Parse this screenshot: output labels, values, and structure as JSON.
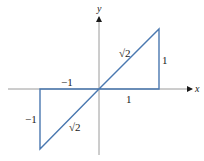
{
  "diagram": {
    "type": "coordinate-geometry",
    "colors": {
      "axis": "#9a9a9a",
      "shape": "#4a78b0",
      "text": "#1a1a1a",
      "background": "#ffffff"
    },
    "axes": {
      "x_label": "x",
      "y_label": "y"
    },
    "upper_triangle": {
      "vertices": [
        [
          0,
          0
        ],
        [
          1,
          0
        ],
        [
          1,
          1
        ]
      ],
      "hypotenuse_label": "√2",
      "vertical_leg_label": "1",
      "horizontal_leg_label": "1"
    },
    "lower_triangle": {
      "vertices": [
        [
          0,
          0
        ],
        [
          -1,
          0
        ],
        [
          -1,
          -1
        ]
      ],
      "hypotenuse_label": "√2",
      "vertical_leg_label": "−1",
      "horizontal_leg_label": "−1"
    }
  }
}
